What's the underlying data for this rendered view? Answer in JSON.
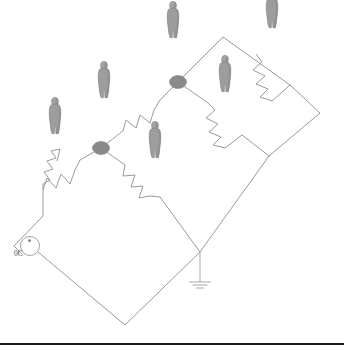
{
  "diagram": {
    "background_color": "#ffffff",
    "wire_color": "#9a9a9a",
    "node_color": "#8a8a8a",
    "figure_color": "#9d9d9d",
    "rule_color": "#1a1a1a",
    "source": {
      "label": "0C",
      "name": "voltage-source",
      "cx": 30,
      "cy": 246,
      "r": 9.5
    },
    "ground": {
      "name": "ground-symbol",
      "x": 200,
      "y_top": 252,
      "y_bottom": 282,
      "bars": [
        {
          "half_width": 11,
          "y": 282
        },
        {
          "half_width": 7.5,
          "y": 285
        },
        {
          "half_width": 4,
          "y": 288
        }
      ]
    },
    "nodes": [
      {
        "name": "node-upper",
        "cx": 178,
        "cy": 82,
        "rx": 8.5,
        "ry": 6.5
      },
      {
        "name": "node-lower",
        "cx": 101,
        "cy": 148,
        "rx": 8.5,
        "ry": 6.5
      }
    ],
    "resistors": [
      {
        "name": "resistor-left-lower",
        "x1": 43,
        "y1": 190,
        "x2": 80,
        "y2": 160
      },
      {
        "name": "resistor-left-upper",
        "x1": 123,
        "y1": 131,
        "x2": 160,
        "y2": 100
      },
      {
        "name": "resistor-middle",
        "x1": 125,
        "y1": 165,
        "x2": 160,
        "y2": 197
      },
      {
        "name": "resistor-right-middle",
        "x1": 208,
        "y1": 103,
        "x2": 242,
        "y2": 135
      },
      {
        "name": "resistor-right-top",
        "x1": 256,
        "y1": 54,
        "x2": 290,
        "y2": 85
      }
    ],
    "wires": [
      {
        "name": "wire-source-to-left-resistor",
        "points": "22,254 14,246 14,246 43,216 43,190"
      },
      {
        "name": "wire-left-resistor-to-node",
        "points": "80,160 101,148"
      },
      {
        "name": "wire-node-to-upper-resistor",
        "points": "101,148 123,131"
      },
      {
        "name": "wire-upper-resistor-to-node-upper",
        "points": "160,100 178,82"
      },
      {
        "name": "wire-node-upper-to-top-corner",
        "points": "178,82 223,37 290,85"
      },
      {
        "name": "wire-node-upper-to-right-resistor",
        "points": "178,82 208,103"
      },
      {
        "name": "wire-right-resistor-to-mid-corner",
        "points": "242,135 269,156"
      },
      {
        "name": "wire-right-top-resistor-to-far-corner",
        "points": "290,85 320,113 269,156"
      },
      {
        "name": "wire-node-to-middle-resistor",
        "points": "101,148 125,165"
      },
      {
        "name": "wire-middle-resistor-to-ground-node",
        "points": "160,197 200,252"
      },
      {
        "name": "wire-ground-node-to-mid-corner",
        "points": "200,252 269,156"
      },
      {
        "name": "wire-source-bottom-loop",
        "points": "38,252 125,325 200,252"
      }
    ],
    "figures": [
      {
        "name": "person-figure-1",
        "x": 55,
        "y": 118
      },
      {
        "name": "person-figure-2",
        "x": 104,
        "y": 82
      },
      {
        "name": "person-figure-3",
        "x": 173,
        "y": 22
      },
      {
        "name": "person-figure-4",
        "x": 155,
        "y": 142
      },
      {
        "name": "person-figure-5",
        "x": 225,
        "y": 76
      },
      {
        "name": "person-figure-6",
        "x": 272,
        "y": 12
      }
    ]
  },
  "bottom_rule": {
    "name": "bottom-horizontal-rule",
    "y": 343
  }
}
